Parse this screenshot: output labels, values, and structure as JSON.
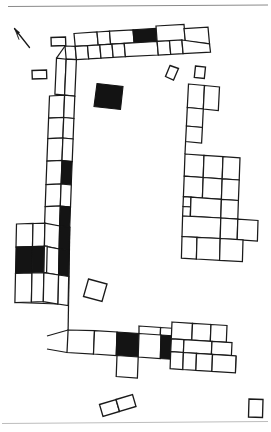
{
  "figure": {
    "kind": "archaeological-site-plan",
    "title": "",
    "caption": "",
    "width": 271,
    "height": 432,
    "background_color": "#ffffff",
    "outline_color": "#1a1a1a",
    "fill_color": "#141414",
    "rule_color": "#8a8a8a"
  },
  "north_arrow": {
    "name": "north-arrow",
    "label": "",
    "bearing_description": "up-and-left",
    "shaft": "M 29.5 47.5 L 14.5 28.5",
    "head": "M 14.5 28.5 L 19.6 32.4 L 17.2 34.2 L 19.0 39.6 Z"
  },
  "rules": [
    {
      "name": "top-rule",
      "x1": 8,
      "y1": 6.5,
      "x2": 268,
      "y2": 5.0,
      "faint": false
    },
    {
      "name": "bottom-rule",
      "x1": 2,
      "y1": 423.5,
      "x2": 268,
      "y2": 421.5,
      "faint": true
    }
  ],
  "north_range": {
    "name": "north-room-range",
    "rooms": [
      {
        "id": "N1",
        "filled": false,
        "points": "74,33.5 97,32.0 98.2,45.0 75.2,46.4"
      },
      {
        "id": "N2",
        "filled": false,
        "points": "97,32.0 109.5,31.2 110.6,44.2 98.2,45.0"
      },
      {
        "id": "N3",
        "filled": false,
        "points": "109.5,31.2 133,29.8 134.1,42.8 110.6,44.2"
      },
      {
        "id": "N4",
        "filled": true,
        "points": "133,29.8 156,28.4 157.1,41.4 134.1,42.8"
      },
      {
        "id": "N5",
        "filled": false,
        "points": "156,26.0 184,24.3 185.3,41.0 157.1,41.4"
      },
      {
        "id": "N6",
        "filled": false,
        "points": "184,28.6 208,27.2 209.5,43.8 185.3,41.0"
      }
    ],
    "rooms_lower": [
      {
        "id": "N7",
        "filled": false,
        "points": "65,46.0 75.2,46.4 76.4,59.6 66.2,59.2"
      },
      {
        "id": "N8",
        "filled": false,
        "points": "75.2,46.4 87.5,45.6 88.7,58.9 76.4,59.6"
      },
      {
        "id": "N9",
        "filled": false,
        "points": "87.5,45.6 99.8,44.9 101.0,58.1 88.7,58.9"
      },
      {
        "id": "N10",
        "filled": false,
        "points": "99.8,44.9 112.0,44.2 113.2,57.4 101.0,58.1"
      },
      {
        "id": "N11",
        "filled": false,
        "points": "112.0,44.2 124.2,43.4 125.4,56.6 113.2,57.4"
      },
      {
        "id": "N12",
        "filled": false,
        "points": "124.2,43.4 157.1,41.4 158.3,55.0 125.4,56.6"
      },
      {
        "id": "N13",
        "filled": false,
        "points": "157.1,41.4 169.5,40.7 170.7,54.3 158.3,55.0"
      },
      {
        "id": "N14",
        "filled": false,
        "points": "169.5,40.7 181.9,40.0 183.1,53.6 170.7,54.3"
      },
      {
        "id": "N15",
        "filled": false,
        "points": "181.9,40.0 209.5,43.8 210.5,52.2 183.1,53.6"
      }
    ]
  },
  "west_range": {
    "name": "west-room-range",
    "rooms": [
      {
        "id": "W1",
        "filled": false,
        "points": "56.5,58.2 66.2,59.2 64.6,95.2 54.9,94.2"
      },
      {
        "id": "W2",
        "filled": false,
        "points": "66.2,59.2 76.4,59.6 74.8,96.2 64.6,95.2"
      },
      {
        "id": "W3",
        "filled": false,
        "points": "49.5,96.0 64.6,95.2 63.7,117.5 48.6,118.2"
      },
      {
        "id": "W4",
        "filled": false,
        "points": "64.6,95.2 74.8,96.2 73.9,118.5 63.7,117.5"
      },
      {
        "id": "W5",
        "filled": false,
        "points": "48.6,118.2 63.7,117.5 62.9,138.0 47.8,138.7"
      },
      {
        "id": "W6",
        "filled": false,
        "points": "63.7,117.5 73.9,118.5 73.1,139.0 62.9,138.0"
      },
      {
        "id": "W7",
        "filled": false,
        "points": "47.8,138.7 62.9,138.0 62.0,160.5 46.9,161.2"
      },
      {
        "id": "W8",
        "filled": false,
        "points": "62.9,138.0 73.1,139.0 72.2,161.5 62.0,160.5"
      },
      {
        "id": "W9",
        "filled": false,
        "points": "46.9,161.2 62.0,160.5 61.1,184.0 46.0,184.7"
      },
      {
        "id": "W10",
        "filled": true,
        "points": "62.0,160.5 72.2,161.5 71.3,185.0 61.1,184.0"
      },
      {
        "id": "W11",
        "filled": false,
        "points": "46.0,184.7 61.1,184.0 60.3,206.0 45.2,206.7"
      },
      {
        "id": "W12",
        "filled": false,
        "points": "61.1,184.0 71.3,185.0 70.5,207.0 60.3,206.0"
      },
      {
        "id": "W13",
        "filled": false,
        "points": "45.2,206.7 60.3,206.0 59.6,226.0 44.5,226.7"
      },
      {
        "id": "W14",
        "filled": true,
        "points": "60.3,206.0 70.5,207.0 69.8,227.0 59.6,226.0"
      }
    ]
  },
  "southwest_block": {
    "name": "southwest-room-block",
    "rooms": [
      {
        "id": "S1",
        "filled": false,
        "points": "16.5,224.0 33.0,223.5 32.5,246.5 16.0,247.0"
      },
      {
        "id": "S2",
        "filled": false,
        "points": "33.0,223.5 44.9,223.2 44.4,246.2 32.5,246.5"
      },
      {
        "id": "S3",
        "filled": false,
        "points": "44.9,223.2 59.6,226.0 59.1,249.0 44.4,246.2"
      },
      {
        "id": "S4",
        "filled": true,
        "points": "59.6,226.0 69.8,227.0 69.2,250.5 59.1,249.0"
      },
      {
        "id": "S5",
        "filled": true,
        "points": "16.0,247.0 32.5,246.5 32.0,273.0 15.5,273.5"
      },
      {
        "id": "S6",
        "filled": true,
        "points": "32.5,246.5 44.4,246.2 43.9,272.6 32.0,273.0"
      },
      {
        "id": "S7",
        "filled": false,
        "points": "44.4,246.2 59.1,249.0 58.6,275.0 43.9,272.6"
      },
      {
        "id": "S8",
        "filled": true,
        "points": "59.1,249.0 69.2,250.5 68.7,276.5 58.6,275.0"
      },
      {
        "id": "S9",
        "filled": false,
        "points": "15.5,273.5 32.0,273.0 31.4,302.0 14.9,302.5"
      },
      {
        "id": "S10",
        "filled": false,
        "points": "32.0,273.0 43.9,272.6 43.3,301.6 31.4,302.0"
      },
      {
        "id": "S11",
        "filled": false,
        "points": "43.9,272.6 58.6,275.0 58.0,304.0 43.3,301.6"
      },
      {
        "id": "S12",
        "filled": false,
        "points": "58.6,275.0 68.7,276.5 68.1,305.5 58.0,304.0"
      }
    ],
    "left_stub": {
      "id": "S13",
      "filled": false,
      "points": "44.4,246.2 47.2,246.1 46.6,272.7 43.9,272.6"
    }
  },
  "south_range": {
    "name": "south-room-range",
    "rooms": [
      {
        "id": "B1",
        "filled": false,
        "points": "68.1,330.0 94.5,330.6 93.5,354.0 67.0,352.5"
      },
      {
        "id": "B2",
        "filled": false,
        "points": "94.5,330.6 117.0,332.0 116.2,355.5 93.5,354.0"
      },
      {
        "id": "B3",
        "filled": true,
        "points": "117.0,332.0 139.0,333.5 138.2,357.0 116.2,355.5"
      },
      {
        "id": "B4",
        "filled": false,
        "points": "139.0,333.5 161.0,335.0 160.3,358.5 138.2,357.0"
      },
      {
        "id": "B5",
        "filled": true,
        "points": "161.0,335.0 183.0,336.5 182.3,360.0 160.3,358.5"
      },
      {
        "id": "B6",
        "filled": false,
        "points": "183.0,336.5 205.0,338.0 204.3,361.5 182.3,360.0"
      },
      {
        "id": "B7",
        "filled": false,
        "points": "117.0,355.5 138.2,357.0 137.4,378.0 116.2,376.5"
      }
    ],
    "upper_rooms": [
      {
        "id": "B8",
        "filled": false,
        "points": "139.0,326.0 160.6,327.5 160.3,336.0 139.0,334.5"
      },
      {
        "id": "B9",
        "filled": false,
        "points": "160.6,327.5 183.0,329.0 182.6,337.5 160.3,336.0"
      }
    ]
  },
  "southeast_block": {
    "name": "southeast-room-block",
    "rooms": [
      {
        "id": "E1",
        "filled": false,
        "points": "172.0,322.0 192.5,323.3 191.8,340.0 171.3,338.8"
      },
      {
        "id": "E2",
        "filled": false,
        "points": "192.5,323.3 211.0,324.5 210.3,341.3 191.8,340.0"
      },
      {
        "id": "E3",
        "filled": false,
        "points": "211.0,324.5 227.0,325.5 226.3,342.3 210.3,341.3"
      },
      {
        "id": "E4",
        "filled": false,
        "points": "171.3,338.8 184.0,339.6 183.4,352.5 170.7,351.7"
      },
      {
        "id": "E5",
        "filled": false,
        "points": "184.0,339.6 212.0,341.4 211.4,354.3 183.4,352.5"
      },
      {
        "id": "E6",
        "filled": false,
        "points": "212.0,341.4 232.0,342.7 231.4,355.6 211.4,354.3"
      },
      {
        "id": "E7",
        "filled": false,
        "points": "170.7,351.7 183.4,352.5 182.8,369.5 170.1,368.7"
      },
      {
        "id": "E8",
        "filled": false,
        "points": "183.4,352.5 196.5,353.4 195.9,370.4 182.8,369.5"
      },
      {
        "id": "E9",
        "filled": false,
        "points": "196.5,353.4 212.5,354.4 211.9,371.4 195.9,370.4"
      },
      {
        "id": "E10",
        "filled": false,
        "points": "212.5,354.4 236.0,355.9 235.4,372.9 211.9,371.4"
      }
    ]
  },
  "east_range": {
    "name": "east-room-range",
    "rooms": [
      {
        "id": "R1",
        "filled": false,
        "points": "188.5,84.0 204.5,85.5 203.3,109.0 187.3,107.5"
      },
      {
        "id": "R2",
        "filled": false,
        "points": "204.5,85.5 219.5,87.0 218.3,110.5 203.3,109.0"
      },
      {
        "id": "R3",
        "filled": false,
        "points": "187.3,107.5 203.3,109.0 202.4,127.5 186.4,126.0"
      },
      {
        "id": "R4",
        "filled": false,
        "points": "186.4,126.0 202.4,127.5 201.6,143.0 185.6,141.5"
      },
      {
        "id": "R5",
        "filled": false,
        "points": "185.0,154.0 204.0,155.3 203.2,177.5 184.2,176.2"
      },
      {
        "id": "R6",
        "filled": false,
        "points": "204.0,155.3 223.0,156.6 222.2,178.8 203.2,177.5"
      },
      {
        "id": "R7",
        "filled": false,
        "points": "223.0,156.6 240.0,157.8 239.2,180.0 222.2,178.8"
      },
      {
        "id": "R8",
        "filled": false,
        "points": "184.2,176.2 203.2,177.5 202.4,198.0 183.4,196.7"
      },
      {
        "id": "R9",
        "filled": false,
        "points": "203.2,177.5 222.2,178.8 221.4,199.3 202.4,198.0"
      },
      {
        "id": "R10",
        "filled": false,
        "points": "222.2,178.8 239.2,180.0 238.4,200.5 221.4,199.3"
      },
      {
        "id": "R11",
        "filled": false,
        "points": "183.4,196.7 191.0,197.2 190.6,207.0 183.0,206.5"
      },
      {
        "id": "R12",
        "filled": false,
        "points": "183.0,206.5 190.6,207.0 190.2,216.5 182.6,216.0"
      },
      {
        "id": "R13",
        "filled": false,
        "points": "191.0,197.2 221.4,199.3 220.8,218.0 190.4,216.0"
      },
      {
        "id": "R14",
        "filled": false,
        "points": "221.4,199.3 238.4,200.5 237.8,219.2 220.8,218.0"
      },
      {
        "id": "R15",
        "filled": false,
        "points": "182.6,216.0 220.8,218.0 220.2,238.5 182.0,236.5"
      },
      {
        "id": "R16",
        "filled": false,
        "points": "220.8,218.0 237.8,219.2 237.2,239.7 220.2,238.5"
      },
      {
        "id": "R17",
        "filled": false,
        "points": "237.8,219.2 258.0,220.5 257.4,241.0 237.2,239.7"
      },
      {
        "id": "R18",
        "filled": false,
        "points": "182.0,236.5 197.0,237.3 196.4,259.0 181.4,258.2"
      },
      {
        "id": "R19",
        "filled": false,
        "points": "197.0,237.3 220.2,238.5 219.6,260.3 196.4,259.0"
      },
      {
        "id": "R20",
        "filled": false,
        "points": "220.2,238.5 243.0,239.8 242.4,261.6 219.6,260.3"
      }
    ]
  },
  "detached_structures": [
    {
      "id": "D1",
      "name": "detached-rect-nw-upper",
      "filled": false,
      "points": "51.0,37.5 65.5,37.0 65.8,45.5 51.3,46.0"
    },
    {
      "id": "D2",
      "name": "detached-rect-nw-lower",
      "filled": false,
      "points": "32.0,70.5 46.5,70.0 46.8,78.5 32.3,79.0"
    },
    {
      "id": "D3",
      "name": "detached-black-square-center",
      "filled": true,
      "points": "97.0,83.5 123.0,86.5 120.5,109.5 94.0,106.5"
    },
    {
      "id": "D4",
      "name": "detached-diamond-ne",
      "filled": false,
      "points": "170.0,65.5 178.5,68.5 173.5,80.0 165.5,76.5"
    },
    {
      "id": "D5",
      "name": "detached-rect-ne",
      "filled": false,
      "points": "195.5,66.0 205.5,67.0 204.3,78.5 194.3,77.5"
    },
    {
      "id": "D6",
      "name": "detached-square-midleft",
      "filled": false,
      "points": "88.5,279.0 107.0,284.0 102.0,301.5 83.5,296.5"
    },
    {
      "id": "D7",
      "name": "detached-double-rect-south-a",
      "filled": false,
      "points": "99.5,404.5 116.0,399.5 119.5,411.5 103.0,416.5"
    },
    {
      "id": "D8",
      "name": "detached-double-rect-south-b",
      "filled": false,
      "points": "116.0,399.5 132.5,394.5 136.0,406.5 119.5,411.5"
    },
    {
      "id": "D9",
      "name": "detached-rect-se-corner",
      "filled": false,
      "points": "249.0,399.0 263.0,399.5 262.5,417.5 248.5,417.0"
    }
  ],
  "wall_lines": [
    {
      "id": "L1",
      "name": "west-wall-extension",
      "d": "M 69.8 227.0 L 68.1 330.0"
    },
    {
      "id": "L2",
      "name": "west-wall-extension-inner",
      "d": "M 59.6 226.0 L 58.0 304.0"
    },
    {
      "id": "L3",
      "name": "south-baseline",
      "d": "M 47.0 336.0 L 68.1 330.0"
    },
    {
      "id": "L4",
      "name": "west-lower-edge",
      "d": "M 14.9 302.5 L 58.0 304.0"
    },
    {
      "id": "L5",
      "name": "north-west-corner-link",
      "d": "M 56.5 58.2 L 65.0 46.0"
    },
    {
      "id": "L6",
      "name": "east-range-north-link",
      "d": "M 185.6 141.5 L 185.0 154.0"
    },
    {
      "id": "L7",
      "name": "south-range-top-edge",
      "d": "M 67.0 352.5 L 47.0 349.0"
    },
    {
      "id": "L8",
      "name": "southeast-outer-edge",
      "d": "M 235.4 372.9 L 236.0 355.9"
    }
  ]
}
